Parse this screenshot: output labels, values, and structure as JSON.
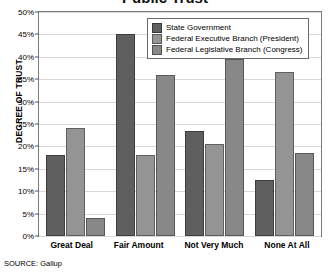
{
  "chart_data": {
    "type": "bar",
    "title": "Public Trust",
    "categories": [
      "Great Deal",
      "Fair Amount",
      "Not Very Much",
      "None At All"
    ],
    "series": [
      {
        "name": "State Government",
        "color": "#5f5f5f",
        "values": [
          18,
          45,
          23.5,
          12.5
        ]
      },
      {
        "name": "Federal Executive Branch (President)",
        "color": "#949494",
        "values": [
          24,
          18,
          20.5,
          36.5
        ]
      },
      {
        "name": "Federal Legislative Branch (Congress)",
        "color": "#888888",
        "values": [
          4,
          36,
          39.5,
          18.5
        ]
      }
    ],
    "xlabel": "",
    "ylabel": "DEGREE OF TRUST",
    "ylim": [
      0,
      50
    ],
    "ytick_labels": [
      "50%",
      "45%",
      "40%",
      "35%",
      "30%",
      "25%",
      "20%",
      "15%",
      "10%",
      "5%",
      "0%"
    ],
    "ytick_values": [
      50,
      45,
      40,
      35,
      30,
      25,
      20,
      15,
      10,
      5,
      0
    ],
    "grid": true,
    "legend_position": "top-right"
  },
  "source": "SOURCE: Gallup"
}
